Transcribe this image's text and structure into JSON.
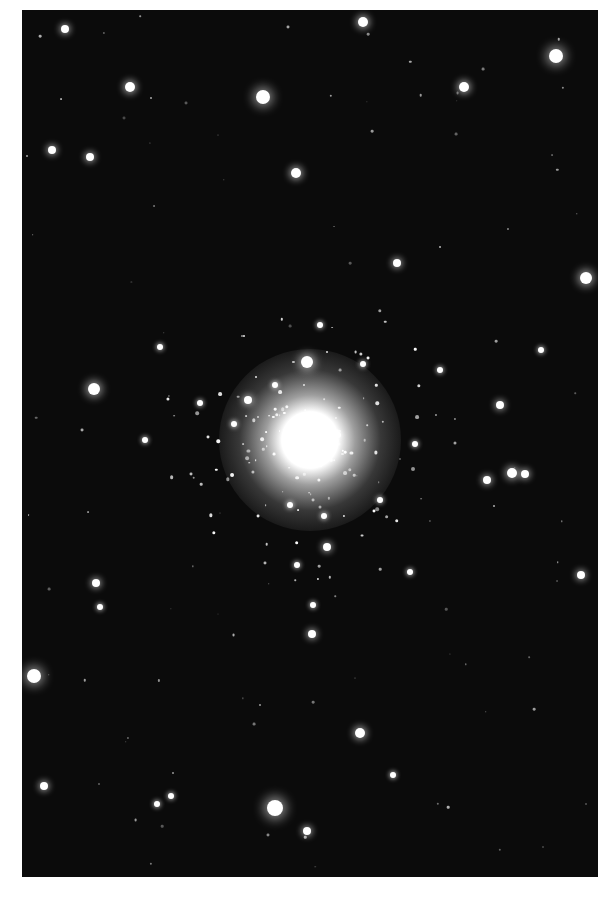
{
  "image": {
    "subject": "globular star cluster",
    "background_color": "#0b0b0b",
    "frame": {
      "x": 22,
      "y": 10,
      "width": 576,
      "height": 867
    },
    "core": {
      "x": 310,
      "y": 440,
      "r": 70
    }
  },
  "stars": [
    [
      363,
      22,
      5
    ],
    [
      65,
      29,
      4
    ],
    [
      556,
      56,
      7
    ],
    [
      130,
      87,
      5
    ],
    [
      263,
      97,
      7
    ],
    [
      464,
      87,
      5
    ],
    [
      52,
      150,
      4
    ],
    [
      90,
      157,
      4
    ],
    [
      296,
      173,
      5
    ],
    [
      397,
      263,
      4
    ],
    [
      586,
      278,
      6
    ],
    [
      160,
      347,
      3
    ],
    [
      94,
      389,
      6
    ],
    [
      307,
      362,
      6
    ],
    [
      541,
      350,
      3
    ],
    [
      500,
      405,
      4
    ],
    [
      487,
      480,
      4
    ],
    [
      512,
      473,
      5
    ],
    [
      525,
      474,
      4
    ],
    [
      581,
      575,
      4
    ],
    [
      96,
      583,
      4
    ],
    [
      312,
      634,
      4
    ],
    [
      34,
      676,
      7
    ],
    [
      360,
      733,
      5
    ],
    [
      44,
      786,
      4
    ],
    [
      275,
      808,
      8
    ],
    [
      307,
      831,
      4
    ],
    [
      157,
      804,
      3
    ],
    [
      171,
      796,
      3
    ],
    [
      393,
      775,
      3
    ],
    [
      100,
      607,
      3
    ],
    [
      248,
      400,
      4
    ],
    [
      338,
      435,
      3
    ],
    [
      290,
      505,
      3
    ],
    [
      324,
      516,
      3
    ],
    [
      327,
      547,
      4
    ],
    [
      297,
      565,
      3
    ],
    [
      313,
      605,
      3
    ],
    [
      234,
      424,
      3
    ],
    [
      415,
      444,
      3
    ],
    [
      380,
      500,
      3
    ],
    [
      200,
      403,
      3
    ],
    [
      145,
      440,
      3
    ],
    [
      410,
      572,
      3
    ],
    [
      363,
      364,
      3
    ],
    [
      320,
      325,
      3
    ],
    [
      275,
      385,
      3
    ],
    [
      440,
      370,
      3
    ]
  ]
}
